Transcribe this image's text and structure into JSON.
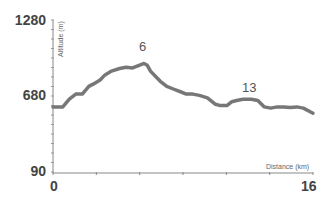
{
  "chart_data": {
    "type": "line",
    "title": "",
    "xlabel": "Distance (km)",
    "ylabel": "Altitude (m)",
    "xlim": [
      0,
      16
    ],
    "ylim": [
      90,
      1280
    ],
    "x_ticks": [
      "0",
      "16"
    ],
    "y_ticks": [
      "1280",
      "680",
      "90"
    ],
    "grid": false,
    "annotations": [
      {
        "label": "6",
        "x": 5.8,
        "y": 930
      },
      {
        "label": "13",
        "x": 12.3,
        "y": 660
      }
    ],
    "series": [
      {
        "name": "elevation",
        "color": "#777777",
        "x": [
          0,
          0.6,
          1.0,
          1.4,
          1.8,
          2.2,
          2.5,
          2.9,
          3.2,
          3.6,
          4.1,
          4.5,
          4.9,
          5.3,
          5.6,
          5.8,
          6.0,
          6.3,
          6.6,
          7.0,
          7.4,
          7.8,
          8.2,
          8.6,
          9.0,
          9.5,
          10.0,
          10.3,
          10.7,
          11.0,
          11.3,
          11.7,
          12.2,
          12.6,
          13.0,
          13.4,
          13.8,
          14.2,
          14.6,
          15.0,
          15.4,
          16.0
        ],
        "y": [
          600,
          600,
          660,
          700,
          700,
          760,
          780,
          810,
          850,
          880,
          900,
          910,
          905,
          925,
          940,
          925,
          880,
          840,
          800,
          760,
          740,
          720,
          700,
          700,
          690,
          670,
          620,
          610,
          610,
          640,
          650,
          660,
          660,
          650,
          600,
          590,
          600,
          600,
          595,
          600,
          590,
          550
        ]
      }
    ]
  },
  "labels": {
    "y_top": "1280",
    "y_mid": "680",
    "y_bottom": "90",
    "x_left": "0",
    "x_right": "16",
    "x_axis_title": "Distance (km)",
    "y_axis_title": "Altitude (m)",
    "peak1": "6",
    "peak2": "13"
  }
}
